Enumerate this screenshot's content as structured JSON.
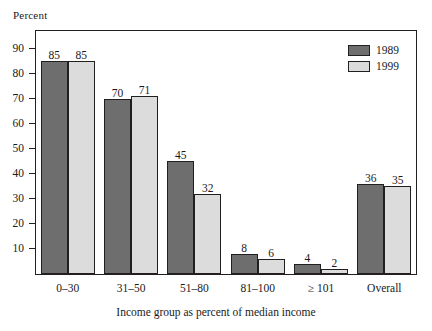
{
  "chart_data": {
    "type": "bar",
    "title": "",
    "subtitle": "",
    "xlabel": "Income group as percent of median income",
    "ylabel": "Percent",
    "categories": [
      "0–30",
      "31–50",
      "51–80",
      "81–100",
      "≥ 101",
      "Overall"
    ],
    "series": [
      {
        "name": "1989",
        "color": "#6e6e6e",
        "values": [
          85,
          70,
          45,
          8,
          4,
          36
        ]
      },
      {
        "name": "1999",
        "color": "#dcdcdc",
        "values": [
          85,
          71,
          32,
          6,
          2,
          35
        ]
      }
    ],
    "ylim": [
      0,
      97
    ],
    "yticks": [
      10,
      20,
      30,
      40,
      50,
      60,
      70,
      80,
      90
    ],
    "ytick_labels": [
      "10",
      "20",
      "30",
      "40",
      "50",
      "60",
      "70",
      "80",
      "90"
    ],
    "grid": false,
    "legend_position": "top-right",
    "value_labels": true
  }
}
